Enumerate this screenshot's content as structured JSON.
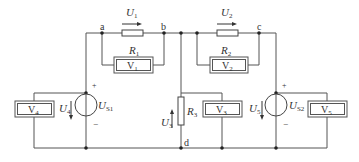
{
  "diagram": {
    "type": "circuit",
    "title": "",
    "nodes": [
      {
        "id": "a",
        "label": "a"
      },
      {
        "id": "b",
        "label": "b"
      },
      {
        "id": "c",
        "label": "c"
      },
      {
        "id": "d",
        "label": "d"
      }
    ],
    "resistors": [
      {
        "id": "R1",
        "main": "R",
        "sub": "1",
        "between": [
          "a",
          "b"
        ]
      },
      {
        "id": "R2",
        "main": "R",
        "sub": "2",
        "between": [
          "junction",
          "c"
        ]
      },
      {
        "id": "R3",
        "main": "R",
        "sub": "3",
        "between": [
          "b",
          "d"
        ]
      }
    ],
    "voltmeters": [
      {
        "id": "V1",
        "main": "V",
        "sub": "1",
        "across": "R1"
      },
      {
        "id": "V2",
        "main": "V",
        "sub": "2",
        "across": "R2"
      },
      {
        "id": "V3",
        "main": "V",
        "sub": "3",
        "across": "R3"
      },
      {
        "id": "V4",
        "main": "V",
        "sub": "4",
        "across": "US1"
      },
      {
        "id": "V5",
        "main": "V",
        "sub": "5",
        "across": "US2"
      }
    ],
    "sources": [
      {
        "id": "US1",
        "main": "U",
        "sub": "S1",
        "plus": "+",
        "minus": "−"
      },
      {
        "id": "US2",
        "main": "U",
        "sub": "S2",
        "plus": "+",
        "minus": "−"
      }
    ],
    "voltages": [
      {
        "id": "U1",
        "main": "U",
        "sub": "1",
        "direction": "right"
      },
      {
        "id": "U2",
        "main": "U",
        "sub": "2",
        "direction": "right"
      },
      {
        "id": "U3",
        "main": "U",
        "sub": "3",
        "direction": "up"
      },
      {
        "id": "U4",
        "main": "U",
        "sub": "4",
        "direction": "down"
      },
      {
        "id": "U5",
        "main": "U",
        "sub": "5",
        "direction": "down"
      }
    ]
  }
}
